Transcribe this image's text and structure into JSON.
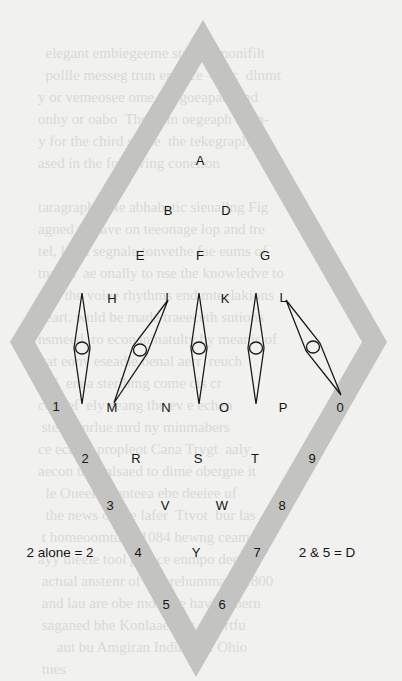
{
  "background_text_lines": [
    "                                               ",
    "          elegant embiegeeme stroeer monifilt",
    "          pollle messeg trun emluce — ac  dlnmt",
    "        y or vemeosee ome telegoeapae  and",
    "        onhy or oabo  The tetm oegeaph isem-",
    "        y for the chird sance  the tekegraply",
    "        ased in the following conetion",
    "        ",
    "        taragraphs  Ne abhabetic sieuallng Fig",
    "        agned to have on teeonage lop and tre",
    "        tel, l een segnale tonvethe fae eums of",
    "        tnaces  ae onally to nse the knowledve to",
    "        e of the voiee rhythms end mteelakions",
    "        heart, wuld be made traeeceth sutions",
    "        nsmeed  ro econaninatulty by meanis of",
    "        ttat eonv eseadle oenal aerr  reuch",
    "        of l  enea sterlbmg come cis cr",
    "        cou  ef  ely eeang the ev e echen",
    "         sterl  enrlue mrd ny minmabers",
    "        ce ecaled propleot Cana Trygt  aaly",
    "        aecon the ealsaed to dime obergne it",
    "          le Oueen Wenteea ebe deeiee uf",
    "          the news of the lafer  Ttvot  bur las",
    "         t homeoomtu lu 1084 hewng ceamnd",
    "        ayy theele tool pomce enmpo deet tr",
    "         actual anstenr of somrehummans 1800",
    "         and lau are obe moretue haviug nern",
    "         saganed bhe Konlaaeaaar ar lertfu",
    "             aut bu Amgiran Indians ot Ohio",
    "         tues"
  ],
  "diagram": {
    "band_color": "#c3c3c1",
    "line_color": "#1a1a1a",
    "outer_diamond": {
      "top": [
        203,
        20
      ],
      "right": [
        387,
        342
      ],
      "bottom": [
        196,
        677
      ],
      "left": [
        10,
        342
      ]
    },
    "inner_diamond": {
      "top": [
        202,
        62
      ],
      "right": [
        362,
        342
      ],
      "bottom": [
        196,
        630
      ],
      "left": [
        35,
        342
      ]
    },
    "needles": [
      {
        "name": "needle-1",
        "from": [
          82,
          293
        ],
        "to": [
          82,
          404
        ],
        "circle": [
          82,
          348
        ]
      },
      {
        "name": "needle-2",
        "from": [
          168,
          300
        ],
        "to": [
          114,
          403
        ],
        "circle": [
          140,
          350
        ]
      },
      {
        "name": "needle-3",
        "from": [
          199,
          293
        ],
        "to": [
          199,
          404
        ],
        "circle": [
          199,
          348
        ]
      },
      {
        "name": "needle-4",
        "from": [
          256,
          293
        ],
        "to": [
          256,
          404
        ],
        "circle": [
          256,
          348
        ]
      },
      {
        "name": "needle-5",
        "from": [
          286,
          300
        ],
        "to": [
          341,
          395
        ],
        "circle": [
          313,
          347
        ]
      }
    ]
  },
  "labels": [
    {
      "text": "A",
      "x": 200,
      "y": 160
    },
    {
      "text": "B",
      "x": 168,
      "y": 210
    },
    {
      "text": "D",
      "x": 226,
      "y": 210
    },
    {
      "text": "E",
      "x": 140,
      "y": 255
    },
    {
      "text": "F",
      "x": 200,
      "y": 255
    },
    {
      "text": "G",
      "x": 265,
      "y": 255
    },
    {
      "text": "H",
      "x": 112,
      "y": 298
    },
    {
      "text": "I",
      "x": 167,
      "y": 297
    },
    {
      "text": "K",
      "x": 225,
      "y": 298
    },
    {
      "text": "L",
      "x": 283,
      "y": 297
    },
    {
      "text": "1",
      "x": 56,
      "y": 406
    },
    {
      "text": "M",
      "x": 112,
      "y": 407
    },
    {
      "text": "N",
      "x": 166,
      "y": 407
    },
    {
      "text": "O",
      "x": 224,
      "y": 407
    },
    {
      "text": "P",
      "x": 283,
      "y": 407
    },
    {
      "text": "0",
      "x": 340,
      "y": 407
    },
    {
      "text": "2",
      "x": 85,
      "y": 458
    },
    {
      "text": "R",
      "x": 136,
      "y": 458
    },
    {
      "text": "S",
      "x": 198,
      "y": 458
    },
    {
      "text": "T",
      "x": 255,
      "y": 458
    },
    {
      "text": "9",
      "x": 312,
      "y": 458
    },
    {
      "text": "3",
      "x": 110,
      "y": 505
    },
    {
      "text": "V",
      "x": 165,
      "y": 505
    },
    {
      "text": "W",
      "x": 222,
      "y": 505
    },
    {
      "text": "8",
      "x": 282,
      "y": 505
    },
    {
      "text": "4",
      "x": 138,
      "y": 552
    },
    {
      "text": "Y",
      "x": 196,
      "y": 552
    },
    {
      "text": "7",
      "x": 257,
      "y": 552
    },
    {
      "text": "5",
      "x": 166,
      "y": 604
    },
    {
      "text": "6",
      "x": 222,
      "y": 604
    }
  ],
  "legend": {
    "left_rule": "2 alone = 2",
    "right_rule": "2 & 5 = D"
  }
}
